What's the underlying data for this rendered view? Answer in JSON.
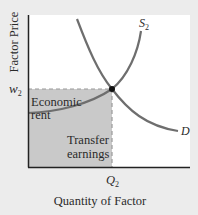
{
  "diagram": {
    "y_axis_label": "Factor Price",
    "x_axis_label": "Quantity of Factor",
    "price_label": "w",
    "price_subscript": "2",
    "quantity_label": "Q",
    "quantity_subscript": "2",
    "supply_label": "S",
    "supply_subscript": "2",
    "demand_label": "D",
    "region_upper_line1": "Economic",
    "region_upper_line2": "rent",
    "region_lower_line1": "Transfer",
    "region_lower_line2": "earnings",
    "colors": {
      "background": "#ececec",
      "plot_area": "#ffffff",
      "shaded_region": "#c9c9c9",
      "curve": "#6e6e6e",
      "axis": "#222222",
      "dashed": "#999999",
      "point": "#111111"
    }
  }
}
